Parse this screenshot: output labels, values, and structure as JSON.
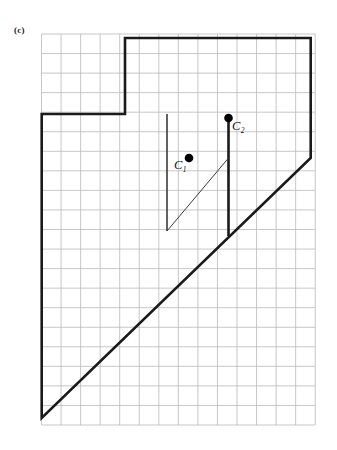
{
  "figure": {
    "panel_label": "(c)",
    "caption_text": "",
    "background_color": "#ffffff",
    "grid_color": "#b9b9bd",
    "stroke_color": "#1a1a1a",
    "thin_stroke_color": "#3a3a3a",
    "point_color": "#000000"
  },
  "points": [
    {
      "id": "C1",
      "letter": "C",
      "subscript": "1",
      "x": 189.0,
      "y": 158.0,
      "grid_x": 7.5,
      "grid_y": 6.3,
      "radius": 4.3
    },
    {
      "id": "C2",
      "letter": "C",
      "subscript": "2",
      "x": 228.5,
      "y": 118.0,
      "grid_x": 9.5,
      "grid_y": 4.3,
      "radius": 4.3
    }
  ],
  "chart_data": {
    "type": "diagram",
    "title": "(c)",
    "xlabel": "",
    "ylabel": "",
    "grid": true,
    "grid_spacing": 19.55,
    "grid_origin": {
      "x": 41.5,
      "y": 34.0
    },
    "grid_columns": 14,
    "grid_rows": 20,
    "xlim": [
      0,
      14
    ],
    "ylim": [
      0,
      20
    ],
    "series": [
      {
        "name": "outer-polygon",
        "kind": "closed-polyline",
        "stroke_width": 2.6,
        "points": [
          [
            125.0,
            38.0
          ],
          [
            310.7,
            38.0
          ],
          [
            310.7,
            158.0
          ],
          [
            41.7,
            418.0
          ],
          [
            41.7,
            114.0
          ],
          [
            125.0,
            114.0
          ]
        ]
      },
      {
        "name": "inner-notch-right",
        "kind": "polyline",
        "stroke_width": 2.6,
        "points": [
          [
            228.5,
            118.0
          ],
          [
            228.5,
            236.0
          ]
        ]
      },
      {
        "name": "inner-notch-left",
        "kind": "polyline",
        "stroke_width": 1.6,
        "points": [
          [
            167.0,
            114.0
          ],
          [
            167.0,
            231.0
          ]
        ]
      },
      {
        "name": "inner-notch-diagonal",
        "kind": "polyline",
        "stroke_width": 1.0,
        "points": [
          [
            167.0,
            231.0
          ],
          [
            228.5,
            158.0
          ]
        ]
      }
    ],
    "annotations": [
      {
        "text": "C",
        "sub": "1",
        "x": 174,
        "y": 159
      },
      {
        "text": "C",
        "sub": "2",
        "x": 232,
        "y": 120
      }
    ]
  }
}
